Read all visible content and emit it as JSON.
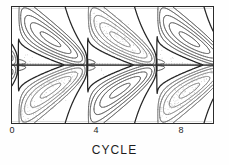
{
  "figure": {
    "kind": "butterfly-diagram-contour-plot",
    "background_color": "#ffffff",
    "frame_color": "#2b2b2b"
  },
  "axes": {
    "xlabel": "CYCLE",
    "x_ticks": [
      {
        "label": "0",
        "value": 0,
        "x_px": 12
      },
      {
        "label": "4",
        "value": 4,
        "x_px": 96
      },
      {
        "label": "8",
        "value": 8,
        "x_px": 181
      }
    ],
    "x_tick_label_y_px": 126,
    "y_ticks": [],
    "y_axis_visible_labels": false
  },
  "chart_data": {
    "type": "heatmap",
    "title": "",
    "subtitle": "",
    "xlabel": "CYCLE",
    "ylabel": "",
    "xlim": [
      -0.6,
      9.1
    ],
    "ylim": [
      -90,
      90
    ],
    "grid": false,
    "legend": "none",
    "annotations": [],
    "tick_labels": {
      "x": [
        "0",
        "4",
        "8"
      ],
      "y": []
    },
    "field_period_cycles": 3.35,
    "equator_y": 0,
    "wings": [
      {
        "cycle_start": -0.3,
        "cycle_end": 2.9,
        "hemisphere": "north",
        "peak_latitude": 88,
        "equator_latitude": 4
      },
      {
        "cycle_start": -0.3,
        "cycle_end": 2.9,
        "hemisphere": "south",
        "peak_latitude": -88,
        "equator_latitude": -4
      },
      {
        "cycle_start": 3.05,
        "cycle_end": 6.25,
        "hemisphere": "north",
        "peak_latitude": 88,
        "equator_latitude": 4
      },
      {
        "cycle_start": 3.05,
        "cycle_end": 6.25,
        "hemisphere": "south",
        "peak_latitude": -88,
        "equator_latitude": -4
      },
      {
        "cycle_start": 6.4,
        "cycle_end": 9.6,
        "hemisphere": "north",
        "peak_latitude": 88,
        "equator_latitude": 4
      },
      {
        "cycle_start": 6.4,
        "cycle_end": 9.6,
        "hemisphere": "south",
        "peak_latitude": -88,
        "equator_latitude": -4
      }
    ],
    "contour_levels": [
      -0.9,
      -0.7,
      -0.5,
      -0.3,
      -0.15,
      0.15,
      0.3,
      0.5,
      0.7,
      0.9
    ],
    "negative_contour_style": "dotted",
    "positive_contour_style": "solid",
    "zero_contour_style": "heavy-solid",
    "series": [
      {
        "name": "positive field contours",
        "values": [
          0.15,
          0.3,
          0.5,
          0.7,
          0.9
        ]
      },
      {
        "name": "negative field contours",
        "values": [
          -0.15,
          -0.3,
          -0.5,
          -0.7,
          -0.9
        ]
      }
    ]
  }
}
